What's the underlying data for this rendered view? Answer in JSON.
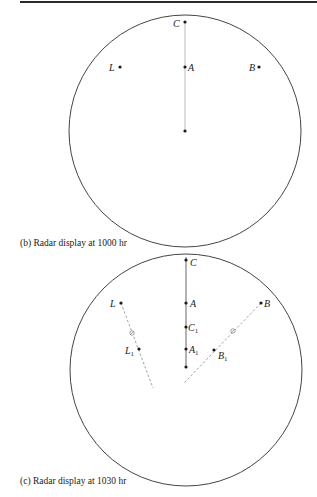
{
  "figure": {
    "panels": [
      {
        "id": "b",
        "caption": "(b) Radar display at 1000 hr",
        "labels": {
          "C": "C",
          "A": "A",
          "L": "L",
          "B": "B"
        }
      },
      {
        "id": "c",
        "caption": "(c) Radar display at 1030 hr",
        "labels": {
          "C": "C",
          "A": "A",
          "L": "L",
          "B": "B",
          "C1": "C",
          "C1_sub": "1",
          "A1": "A",
          "A1_sub": "1",
          "L1": "L",
          "L1_sub": "1",
          "B1": "B",
          "B1_sub": "1"
        }
      }
    ]
  },
  "colors": {
    "ink": "#1a1a1a",
    "circle": "#444444",
    "track": "#9a9a9a"
  }
}
